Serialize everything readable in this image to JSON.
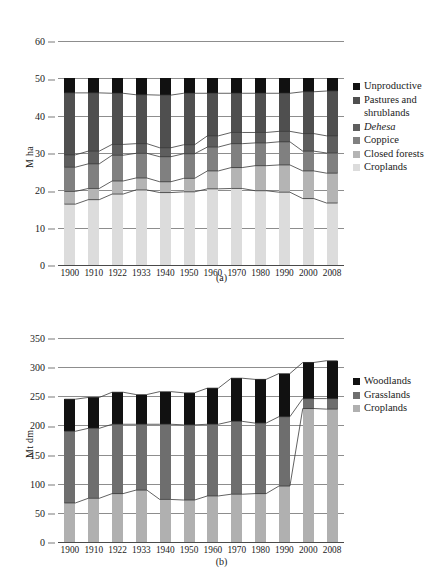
{
  "figure": {
    "panels": [
      {
        "id": "a",
        "caption": "(a)",
        "ylabel": "M ha",
        "yticks": [
          0,
          10,
          20,
          30,
          40,
          50,
          60
        ],
        "legend": [
          {
            "label": "Unproductive",
            "color": "#111111",
            "italic": false
          },
          {
            "label": "Pastures and",
            "color": "#4f4f4f",
            "italic": false,
            "cont": "shrublands"
          },
          {
            "label": "Dehesa",
            "color": "#5e5e5e",
            "italic": true
          },
          {
            "label": "Coppice",
            "color": "#808080",
            "italic": false
          },
          {
            "label": "Closed forests",
            "color": "#b4b4b4",
            "italic": false
          },
          {
            "label": "Croplands",
            "color": "#dcdcdc",
            "italic": false
          }
        ]
      },
      {
        "id": "b",
        "caption": "(b)",
        "ylabel": "Mt dm",
        "yticks": [
          0,
          50,
          100,
          150,
          200,
          250,
          300,
          350
        ],
        "legend": [
          {
            "label": "Woodlands",
            "color": "#111111",
            "italic": false
          },
          {
            "label": "Grasslands",
            "color": "#6e6e6e",
            "italic": false
          },
          {
            "label": "Croplands",
            "color": "#b0b0b0",
            "italic": false
          }
        ]
      }
    ]
  },
  "chart_data": [
    {
      "type": "bar",
      "panel": "a",
      "stacked": true,
      "title": "",
      "xlabel": "",
      "ylabel": "M ha",
      "ylim": [
        0,
        60
      ],
      "ytick_values": [
        0,
        10,
        20,
        30,
        40,
        50,
        60
      ],
      "grid": true,
      "legend_position": "right",
      "categories": [
        "1900",
        "1910",
        "1922",
        "1933",
        "1940",
        "1950",
        "1960",
        "1970",
        "1980",
        "1990",
        "2000",
        "2008"
      ],
      "series": [
        {
          "name": "Croplands",
          "color": "#dcdcdc",
          "values": [
            16.3,
            17.5,
            19.0,
            20.1,
            19.4,
            19.6,
            20.4,
            20.5,
            19.9,
            19.5,
            17.8,
            16.6
          ]
        },
        {
          "name": "Closed forests",
          "color": "#b4b4b4",
          "values": [
            3.4,
            3.0,
            3.5,
            3.2,
            2.9,
            3.6,
            4.8,
            5.6,
            6.7,
            7.3,
            7.4,
            8.0
          ]
        },
        {
          "name": "Coppice",
          "color": "#808080",
          "values": [
            6.5,
            6.6,
            6.9,
            6.6,
            6.7,
            6.6,
            6.4,
            6.4,
            6.1,
            6.2,
            5.3,
            5.4
          ]
        },
        {
          "name": "Dehesa",
          "color": "#5e5e5e",
          "values": [
            3.3,
            3.4,
            2.9,
            2.6,
            2.4,
            2.4,
            3.0,
            3.0,
            2.8,
            2.8,
            4.7,
            4.6
          ]
        },
        {
          "name": "Pastures and shrublands",
          "color": "#4f4f4f",
          "values": [
            16.6,
            15.6,
            13.7,
            13.1,
            14.1,
            13.8,
            11.4,
            10.5,
            10.5,
            10.2,
            11.2,
            12.0
          ]
        },
        {
          "name": "Unproductive",
          "color": "#111111",
          "values": [
            3.9,
            3.9,
            4.0,
            4.4,
            4.5,
            4.0,
            4.0,
            4.0,
            4.0,
            4.0,
            3.6,
            3.4
          ]
        }
      ],
      "series_totals": [
        50,
        50,
        50,
        50,
        50,
        50,
        50,
        50,
        50,
        50,
        50,
        50
      ],
      "cumulative_boundaries": {
        "croplands_top": [
          16.3,
          17.5,
          19.0,
          20.1,
          19.4,
          19.6,
          20.4,
          20.5,
          19.9,
          19.5,
          17.8,
          16.6
        ],
        "closed_forests_top": [
          19.7,
          20.5,
          22.5,
          23.3,
          22.3,
          23.2,
          25.2,
          26.1,
          26.6,
          26.8,
          25.2,
          24.6
        ],
        "coppice_top": [
          26.2,
          27.1,
          29.4,
          29.9,
          29.0,
          29.8,
          31.6,
          32.5,
          32.7,
          33.0,
          30.5,
          30.0
        ],
        "dehesa_top": [
          29.5,
          30.5,
          32.3,
          32.5,
          31.4,
          32.2,
          34.6,
          35.5,
          35.5,
          35.8,
          35.2,
          34.6
        ],
        "pastures_top": [
          46.1,
          46.1,
          46.0,
          45.6,
          45.5,
          46.0,
          46.0,
          46.0,
          46.0,
          46.0,
          46.4,
          46.6
        ],
        "unproductive_top": [
          50,
          50,
          50,
          50,
          50,
          50,
          50,
          50,
          50,
          50,
          50,
          50
        ]
      }
    },
    {
      "type": "bar",
      "panel": "b",
      "stacked": true,
      "title": "",
      "xlabel": "",
      "ylabel": "Mt dm",
      "ylim": [
        0,
        350
      ],
      "ytick_values": [
        0,
        50,
        100,
        150,
        200,
        250,
        300,
        350
      ],
      "grid": true,
      "legend_position": "right",
      "categories": [
        "1900",
        "1910",
        "1922",
        "1933",
        "1940",
        "1950",
        "1960",
        "1970",
        "1980",
        "1990",
        "2000",
        "2008"
      ],
      "series": [
        {
          "name": "Croplands",
          "color": "#b0b0b0",
          "values": [
            67,
            75,
            83,
            89,
            73,
            72,
            79,
            82,
            83,
            96,
            229,
            228
          ]
        },
        {
          "name": "Grasslands",
          "color": "#6e6e6e",
          "values": [
            123,
            120,
            119,
            113,
            129,
            129,
            123,
            125,
            121,
            119,
            17,
            18
          ]
        },
        {
          "name": "Woodlands",
          "color": "#111111",
          "values": [
            55,
            53,
            55,
            51,
            56,
            55,
            62,
            74,
            75,
            74,
            62,
            65
          ]
        }
      ],
      "series_totals": [
        245,
        248,
        257,
        253,
        258,
        256,
        264,
        281,
        279,
        289,
        308,
        311
      ],
      "cumulative_boundaries": {
        "croplands_top": [
          67,
          75,
          83,
          89,
          73,
          72,
          79,
          82,
          83,
          96,
          229,
          228
        ],
        "grasslands_top": [
          190,
          195,
          202,
          202,
          202,
          201,
          202,
          207,
          204,
          215,
          246,
          246
        ],
        "woodlands_top": [
          245,
          248,
          257,
          253,
          258,
          256,
          264,
          281,
          279,
          289,
          308,
          311
        ]
      }
    }
  ]
}
